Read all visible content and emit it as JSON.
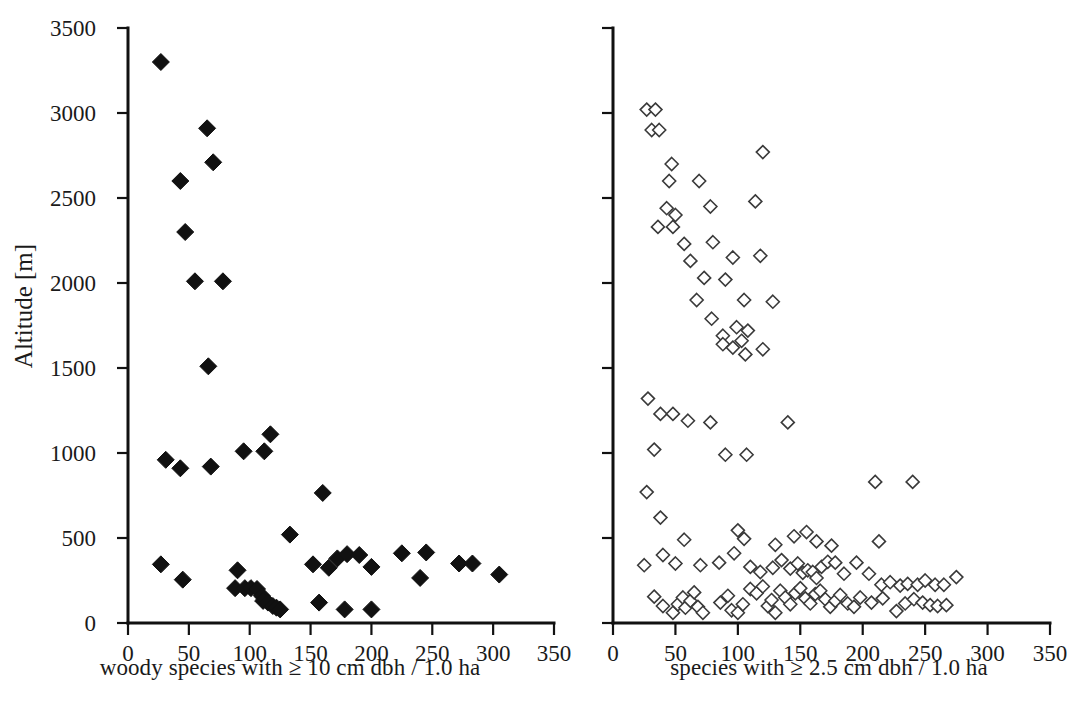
{
  "figure": {
    "width": 1078,
    "height": 718,
    "background": "#ffffff",
    "marker_color": "#111111",
    "axis_color": "#111111",
    "open_marker_stroke": "#3a3a3a"
  },
  "chart_data": [
    {
      "type": "scatter",
      "panel": "left",
      "title": "",
      "xlabel": "woody species with ≥ 10 cm dbh / 1.0 ha",
      "ylabel": "Altitude [m]",
      "xlim": [
        0,
        350
      ],
      "ylim": [
        0,
        3500
      ],
      "xticks": [
        0,
        50,
        100,
        150,
        200,
        250,
        300,
        350
      ],
      "xtick_labels": [
        "0",
        "50",
        "100",
        "150",
        "200",
        "250",
        "300",
        "350"
      ],
      "yticks": [
        0,
        500,
        1000,
        1500,
        2000,
        2500,
        3000,
        3500
      ],
      "ytick_labels": [
        "0",
        "500",
        "1000",
        "1500",
        "2000",
        "2500",
        "3000",
        "3500"
      ],
      "grid": false,
      "legend": null,
      "marker": "filled-diamond",
      "series": [
        {
          "name": "woody species richness vs altitude",
          "points": [
            [
              27,
              3300
            ],
            [
              65,
              2910
            ],
            [
              70,
              2710
            ],
            [
              43,
              2600
            ],
            [
              47,
              2300
            ],
            [
              55,
              2010
            ],
            [
              78,
              2010
            ],
            [
              66,
              1510
            ],
            [
              117,
              1110
            ],
            [
              95,
              1010
            ],
            [
              112,
              1010
            ],
            [
              31,
              960
            ],
            [
              43,
              910
            ],
            [
              68,
              920
            ],
            [
              160,
              765
            ],
            [
              133,
              520
            ],
            [
              27,
              345
            ],
            [
              45,
              255
            ],
            [
              90,
              310
            ],
            [
              157,
              120
            ],
            [
              152,
              345
            ],
            [
              165,
              325
            ],
            [
              172,
              380
            ],
            [
              180,
              405
            ],
            [
              190,
              400
            ],
            [
              200,
              330
            ],
            [
              225,
              410
            ],
            [
              245,
              415
            ],
            [
              240,
              265
            ],
            [
              272,
              350
            ],
            [
              283,
              350
            ],
            [
              305,
              285
            ],
            [
              88,
              205
            ],
            [
              96,
              205
            ],
            [
              101,
              205
            ],
            [
              106,
              200
            ],
            [
              110,
              160
            ],
            [
              111,
              130
            ],
            [
              115,
              120
            ],
            [
              119,
              100
            ],
            [
              122,
              90
            ],
            [
              125,
              80
            ],
            [
              178,
              80
            ],
            [
              200,
              80
            ]
          ]
        }
      ]
    },
    {
      "type": "scatter",
      "panel": "right",
      "title": "",
      "xlabel": "species with ≥ 2.5 cm dbh / 1.0 ha",
      "ylabel": "",
      "xlim": [
        0,
        350
      ],
      "ylim": [
        0,
        3500
      ],
      "xticks": [
        0,
        50,
        100,
        150,
        200,
        250,
        300,
        350
      ],
      "xtick_labels": [
        "0",
        "50",
        "100",
        "150",
        "200",
        "250",
        "300",
        "350"
      ],
      "yticks": [
        0,
        500,
        1000,
        1500,
        2000,
        2500,
        3000,
        3500
      ],
      "ytick_labels": [
        "",
        "",
        "",
        "",
        "",
        "",
        "",
        ""
      ],
      "grid": false,
      "legend": null,
      "marker": "open-diamond",
      "series": [
        {
          "name": "species richness vs altitude",
          "points": [
            [
              27,
              3020
            ],
            [
              34,
              3020
            ],
            [
              31,
              2900
            ],
            [
              37,
              2900
            ],
            [
              47,
              2700
            ],
            [
              45,
              2600
            ],
            [
              43,
              2440
            ],
            [
              50,
              2400
            ],
            [
              48,
              2330
            ],
            [
              36,
              2330
            ],
            [
              57,
              2230
            ],
            [
              62,
              2130
            ],
            [
              73,
              2030
            ],
            [
              67,
              1900
            ],
            [
              79,
              1790
            ],
            [
              88,
              1690
            ],
            [
              103,
              1660
            ],
            [
              69,
              2600
            ],
            [
              78,
              2450
            ],
            [
              80,
              2240
            ],
            [
              96,
              2150
            ],
            [
              90,
              2020
            ],
            [
              105,
              1900
            ],
            [
              120,
              2770
            ],
            [
              114,
              2480
            ],
            [
              118,
              2160
            ],
            [
              128,
              1890
            ],
            [
              88,
              1640
            ],
            [
              96,
              1620
            ],
            [
              106,
              1580
            ],
            [
              120,
              1610
            ],
            [
              99,
              1740
            ],
            [
              108,
              1720
            ],
            [
              28,
              1320
            ],
            [
              38,
              1230
            ],
            [
              48,
              1230
            ],
            [
              60,
              1190
            ],
            [
              78,
              1180
            ],
            [
              140,
              1180
            ],
            [
              33,
              1020
            ],
            [
              90,
              990
            ],
            [
              107,
              990
            ],
            [
              27,
              770
            ],
            [
              38,
              620
            ],
            [
              100,
              545
            ],
            [
              105,
              495
            ],
            [
              57,
              490
            ],
            [
              130,
              460
            ],
            [
              145,
              510
            ],
            [
              155,
              535
            ],
            [
              163,
              480
            ],
            [
              175,
              455
            ],
            [
              210,
              830
            ],
            [
              240,
              830
            ],
            [
              213,
              480
            ],
            [
              40,
              400
            ],
            [
              25,
              340
            ],
            [
              50,
              350
            ],
            [
              70,
              340
            ],
            [
              85,
              355
            ],
            [
              97,
              410
            ],
            [
              110,
              330
            ],
            [
              118,
              300
            ],
            [
              128,
              325
            ],
            [
              135,
              370
            ],
            [
              142,
              320
            ],
            [
              148,
              350
            ],
            [
              152,
              295
            ],
            [
              156,
              310
            ],
            [
              160,
              300
            ],
            [
              163,
              265
            ],
            [
              167,
              330
            ],
            [
              172,
              360
            ],
            [
              178,
              355
            ],
            [
              185,
              290
            ],
            [
              195,
              355
            ],
            [
              205,
              290
            ],
            [
              215,
              225
            ],
            [
              222,
              240
            ],
            [
              230,
              220
            ],
            [
              236,
              230
            ],
            [
              244,
              225
            ],
            [
              250,
              250
            ],
            [
              258,
              225
            ],
            [
              265,
              225
            ],
            [
              275,
              270
            ],
            [
              33,
              155
            ],
            [
              40,
              100
            ],
            [
              48,
              60
            ],
            [
              52,
              110
            ],
            [
              56,
              150
            ],
            [
              58,
              90
            ],
            [
              62,
              130
            ],
            [
              65,
              180
            ],
            [
              68,
              95
            ],
            [
              72,
              60
            ],
            [
              86,
              120
            ],
            [
              92,
              160
            ],
            [
              95,
              75
            ],
            [
              100,
              60
            ],
            [
              104,
              110
            ],
            [
              110,
              200
            ],
            [
              115,
              175
            ],
            [
              120,
              215
            ],
            [
              124,
              100
            ],
            [
              127,
              135
            ],
            [
              130,
              60
            ],
            [
              134,
              190
            ],
            [
              138,
              150
            ],
            [
              142,
              110
            ],
            [
              146,
              175
            ],
            [
              150,
              205
            ],
            [
              154,
              145
            ],
            [
              158,
              115
            ],
            [
              162,
              170
            ],
            [
              166,
              190
            ],
            [
              170,
              140
            ],
            [
              174,
              95
            ],
            [
              178,
              130
            ],
            [
              182,
              165
            ],
            [
              188,
              115
            ],
            [
              193,
              95
            ],
            [
              198,
              150
            ],
            [
              207,
              120
            ],
            [
              216,
              145
            ],
            [
              227,
              70
            ],
            [
              234,
              115
            ],
            [
              241,
              140
            ],
            [
              248,
              120
            ],
            [
              254,
              105
            ],
            [
              260,
              100
            ],
            [
              267,
              105
            ]
          ]
        }
      ]
    }
  ],
  "panels": {
    "left": {
      "x_axis_title": "woody species with ≥ 10 cm dbh / 1.0 ha",
      "y_axis_title": "Altitude [m]"
    },
    "right": {
      "x_axis_title": "species with ≥ 2.5 cm dbh / 1.0 ha"
    }
  }
}
